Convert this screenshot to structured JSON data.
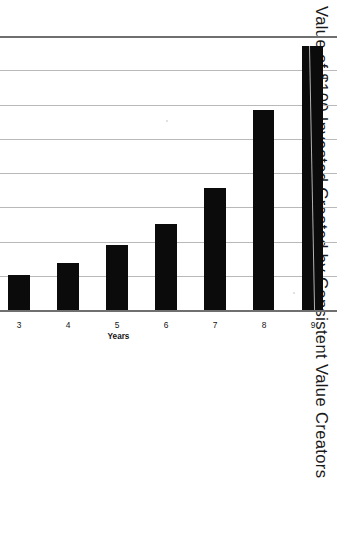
{
  "chart_data": {
    "type": "bar",
    "orientation": "horizontal",
    "title": "Value of $100 Invested Created by Consistent Value Creators",
    "xlabel": "Years",
    "ylabel": "$ Value Created Per $100 Invested",
    "categories": [
      "1",
      "2",
      "3",
      "4",
      "5",
      "6",
      "7",
      "8",
      "9"
    ],
    "values": [
      88,
      158,
      204,
      274,
      380,
      502,
      712,
      1170,
      1540
    ],
    "tick_labels": [
      "$0",
      "$200",
      "$400",
      "$600",
      "$800",
      "$1,000",
      "$1,200",
      "$1,400",
      "$1,600"
    ],
    "tick_values": [
      0,
      200,
      400,
      600,
      800,
      1000,
      1200,
      1400,
      1600
    ],
    "ylim": [
      0,
      1600
    ],
    "grid": true,
    "legend": "none",
    "bar_color": "#0b0b0b",
    "axis_color": "#6f6f6f",
    "gridline_color": "#b9b9b9",
    "series": [
      {
        "name": "$ Value Created Per $100 Invested",
        "values": [
          88,
          158,
          204,
          274,
          380,
          502,
          712,
          1170,
          1540
        ]
      }
    ]
  },
  "page": {
    "background": "#ffffff",
    "rotation_degrees": 90,
    "note_text": ""
  }
}
